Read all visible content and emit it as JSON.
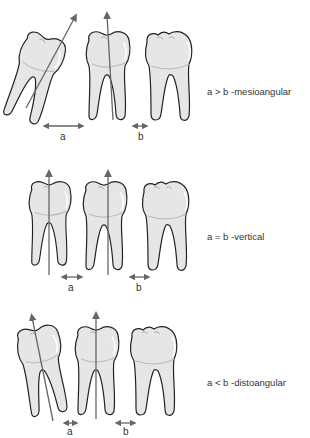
{
  "diagram": {
    "colors": {
      "tooth_fill": "#e6e6e6",
      "tooth_highlight": "#f7f7f7",
      "tooth_outline": "#222222",
      "axis_arrow": "#666666",
      "text": "#333333"
    },
    "rows": [
      {
        "id": "mesioangular",
        "caption": "a > b -mesioangular",
        "label_a": "a",
        "label_b": "b",
        "relation": "a > b"
      },
      {
        "id": "vertical",
        "caption": "a = b -vertical",
        "label_a": "a",
        "label_b": "b",
        "relation": "a = b"
      },
      {
        "id": "distoangular",
        "caption": "a < b -distoangular",
        "label_a": "a",
        "label_b": "b",
        "relation": "a < b"
      }
    ]
  }
}
